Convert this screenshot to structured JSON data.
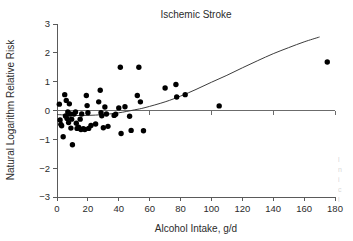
{
  "chart_data": {
    "type": "scatter",
    "title": "Ischemic Stroke",
    "xlabel": "Alcohol Intake, g/d",
    "ylabel": "Natural Logarithm Relative Risk",
    "xlim": [
      0,
      180
    ],
    "ylim": [
      -3,
      3
    ],
    "xticks": [
      0,
      20,
      40,
      60,
      80,
      100,
      120,
      140,
      160,
      180
    ],
    "yticks": [
      3,
      2,
      1,
      0,
      -1,
      -2,
      -3
    ],
    "xtick_labels": [
      "0",
      "20",
      "40",
      "60",
      "80",
      "100",
      "120",
      "140",
      "160",
      "180"
    ],
    "ytick_labels": [
      "3",
      "2",
      "1",
      "0",
      "−1",
      "−2",
      "−3"
    ],
    "grid": false,
    "legend": null,
    "zero_reference_line": 0,
    "point_color": "#000000",
    "curve_color": "#3c3c3c",
    "axis_color": "#5a5a5a",
    "series": [
      {
        "name": "Study estimates",
        "marker": "filled-circle",
        "points": [
          [
            1.5,
            0.22
          ],
          [
            2.0,
            -0.33
          ],
          [
            2.5,
            -0.48
          ],
          [
            3.0,
            -0.53
          ],
          [
            4.0,
            -0.91
          ],
          [
            5.0,
            0.55
          ],
          [
            5.5,
            -0.19
          ],
          [
            6.0,
            0.35
          ],
          [
            6.5,
            -0.28
          ],
          [
            7.0,
            -0.05
          ],
          [
            7.5,
            -0.42
          ],
          [
            8.0,
            0.23
          ],
          [
            8.5,
            -0.12
          ],
          [
            9.0,
            -0.61
          ],
          [
            9.5,
            -0.3
          ],
          [
            10.0,
            -1.19
          ],
          [
            11.0,
            -0.12
          ],
          [
            12.0,
            -0.05
          ],
          [
            12.5,
            -0.44
          ],
          [
            13.0,
            -0.62
          ],
          [
            14.0,
            -0.58
          ],
          [
            15.0,
            -0.3
          ],
          [
            15.5,
            -0.66
          ],
          [
            16.0,
            -0.12
          ],
          [
            17.0,
            -0.63
          ],
          [
            18.0,
            -0.66
          ],
          [
            19.0,
            0.52
          ],
          [
            19.5,
            0.17
          ],
          [
            20.0,
            -0.08
          ],
          [
            20.5,
            -0.62
          ],
          [
            22.0,
            -0.52
          ],
          [
            25.0,
            -0.47
          ],
          [
            27.0,
            0.3
          ],
          [
            28.0,
            0.7
          ],
          [
            28.5,
            -0.08
          ],
          [
            29.0,
            -0.18
          ],
          [
            30.0,
            -0.6
          ],
          [
            31.0,
            0.12
          ],
          [
            32.0,
            -0.12
          ],
          [
            33.0,
            -0.55
          ],
          [
            37.0,
            -0.17
          ],
          [
            38.0,
            -0.13
          ],
          [
            40.0,
            0.09
          ],
          [
            41.0,
            1.5
          ],
          [
            41.5,
            -0.8
          ],
          [
            44.0,
            0.13
          ],
          [
            47.0,
            -0.2
          ],
          [
            48.0,
            -0.69
          ],
          [
            52.0,
            0.52
          ],
          [
            53.0,
            1.5
          ],
          [
            54.0,
            0.3
          ],
          [
            56.0,
            -0.7
          ],
          [
            70.0,
            0.78
          ],
          [
            77.0,
            0.9
          ],
          [
            77.5,
            0.47
          ],
          [
            83.0,
            0.55
          ],
          [
            105.0,
            0.16
          ],
          [
            175.0,
            1.68
          ]
        ]
      }
    ],
    "fitted_curve": {
      "name": "Fitted spline",
      "points": [
        [
          0,
          -0.14
        ],
        [
          10,
          -0.17
        ],
        [
          20,
          -0.17
        ],
        [
          30,
          -0.14
        ],
        [
          40,
          -0.08
        ],
        [
          50,
          0.02
        ],
        [
          57,
          0.1
        ],
        [
          70,
          0.3
        ],
        [
          80,
          0.5
        ],
        [
          90,
          0.73
        ],
        [
          100,
          0.98
        ],
        [
          110,
          1.22
        ],
        [
          120,
          1.48
        ],
        [
          130,
          1.73
        ],
        [
          140,
          1.97
        ],
        [
          150,
          2.18
        ],
        [
          160,
          2.38
        ],
        [
          170,
          2.55
        ]
      ]
    }
  },
  "edge_artifact": {
    "lines": [
      "l",
      "n",
      "i",
      "c",
      "l"
    ]
  }
}
